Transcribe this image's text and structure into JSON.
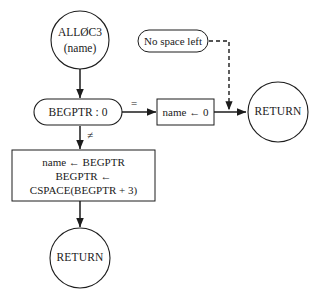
{
  "diagram": {
    "background_color": "#ffffff",
    "line_color": "#1c1c1c",
    "text_color": "#1a1a1a"
  },
  "nodes": {
    "start": {
      "shape": "circle",
      "line1": "ALLØC3",
      "line2": "(name)"
    },
    "decision": {
      "shape": "stadium",
      "label": "BEGPTR : 0"
    },
    "assign_zero": {
      "shape": "rectangle",
      "label": "name ← 0"
    },
    "note": {
      "shape": "stadium",
      "label": "No space left"
    },
    "process": {
      "shape": "rectangle",
      "line1": "name ← BEGPTR",
      "line2": "BEGPTR ←",
      "line3": "CSPACE(BEGPTR + 3)"
    },
    "return_right": {
      "shape": "circle",
      "label": "RETURN"
    },
    "return_bottom": {
      "shape": "circle",
      "label": "RETURN"
    }
  },
  "edge_labels": {
    "equal": "=",
    "not_equal": "≠"
  }
}
